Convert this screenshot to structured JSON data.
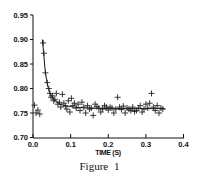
{
  "figure": {
    "caption": "Figure 1"
  },
  "chart_data": {
    "type": "scatter",
    "title": "",
    "xlabel": "TIME (S)",
    "ylabel": "",
    "xlim": [
      0.0,
      0.4
    ],
    "ylim": [
      0.7,
      0.95
    ],
    "x_ticks": [
      "0.0",
      "0.1",
      "0.2",
      "0.3",
      "0.4"
    ],
    "y_ticks": [
      "0.95",
      "0.90",
      "0.85",
      "0.80",
      "0.75",
      "0.70"
    ],
    "grid": false,
    "legend": null,
    "marker": "+",
    "series": [
      {
        "name": "measured",
        "type": "scatter",
        "marker": "+",
        "points": [
          [
            0.004,
            0.766
          ],
          [
            0.008,
            0.75
          ],
          [
            0.013,
            0.756
          ],
          [
            0.018,
            0.748
          ],
          [
            0.027,
            0.893
          ],
          [
            0.029,
            0.872
          ],
          [
            0.033,
            0.832
          ],
          [
            0.038,
            0.812
          ],
          [
            0.042,
            0.8
          ],
          [
            0.045,
            0.79
          ],
          [
            0.048,
            0.782
          ],
          [
            0.052,
            0.785
          ],
          [
            0.055,
            0.775
          ],
          [
            0.058,
            0.778
          ],
          [
            0.062,
            0.79
          ],
          [
            0.066,
            0.768
          ],
          [
            0.07,
            0.772
          ],
          [
            0.074,
            0.762
          ],
          [
            0.078,
            0.788
          ],
          [
            0.082,
            0.77
          ],
          [
            0.086,
            0.764
          ],
          [
            0.09,
            0.758
          ],
          [
            0.094,
            0.775
          ],
          [
            0.098,
            0.752
          ],
          [
            0.102,
            0.78
          ],
          [
            0.106,
            0.765
          ],
          [
            0.11,
            0.77
          ],
          [
            0.115,
            0.76
          ],
          [
            0.12,
            0.768
          ],
          [
            0.125,
            0.755
          ],
          [
            0.13,
            0.772
          ],
          [
            0.135,
            0.762
          ],
          [
            0.14,
            0.75
          ],
          [
            0.145,
            0.765
          ],
          [
            0.15,
            0.758
          ],
          [
            0.155,
            0.76
          ],
          [
            0.16,
            0.745
          ],
          [
            0.165,
            0.768
          ],
          [
            0.17,
            0.763
          ],
          [
            0.175,
            0.76
          ],
          [
            0.18,
            0.752
          ],
          [
            0.185,
            0.758
          ],
          [
            0.19,
            0.765
          ],
          [
            0.195,
            0.762
          ],
          [
            0.2,
            0.756
          ],
          [
            0.205,
            0.762
          ],
          [
            0.21,
            0.76
          ],
          [
            0.215,
            0.75
          ],
          [
            0.22,
            0.758
          ],
          [
            0.225,
            0.782
          ],
          [
            0.23,
            0.762
          ],
          [
            0.235,
            0.757
          ],
          [
            0.24,
            0.764
          ],
          [
            0.245,
            0.75
          ],
          [
            0.25,
            0.76
          ],
          [
            0.255,
            0.758
          ],
          [
            0.26,
            0.755
          ],
          [
            0.265,
            0.762
          ],
          [
            0.27,
            0.753
          ],
          [
            0.275,
            0.755
          ],
          [
            0.28,
            0.76
          ],
          [
            0.285,
            0.765
          ],
          [
            0.29,
            0.752
          ],
          [
            0.295,
            0.758
          ],
          [
            0.3,
            0.768
          ],
          [
            0.305,
            0.76
          ],
          [
            0.31,
            0.77
          ],
          [
            0.315,
            0.79
          ],
          [
            0.32,
            0.762
          ],
          [
            0.325,
            0.755
          ],
          [
            0.33,
            0.765
          ],
          [
            0.335,
            0.75
          ],
          [
            0.34,
            0.76
          ],
          [
            0.345,
            0.758
          ]
        ]
      },
      {
        "name": "fit",
        "type": "line",
        "points": [
          [
            0.025,
            0.9
          ],
          [
            0.028,
            0.875
          ],
          [
            0.032,
            0.84
          ],
          [
            0.036,
            0.818
          ],
          [
            0.04,
            0.803
          ],
          [
            0.045,
            0.791
          ],
          [
            0.05,
            0.783
          ],
          [
            0.06,
            0.774
          ],
          [
            0.07,
            0.769
          ],
          [
            0.08,
            0.766
          ],
          [
            0.1,
            0.763
          ],
          [
            0.12,
            0.761
          ],
          [
            0.15,
            0.76
          ],
          [
            0.2,
            0.759
          ],
          [
            0.25,
            0.759
          ],
          [
            0.3,
            0.759
          ],
          [
            0.35,
            0.759
          ]
        ]
      }
    ]
  }
}
